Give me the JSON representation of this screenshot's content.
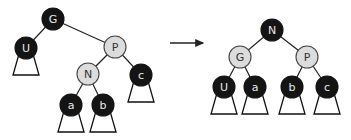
{
  "colors": {
    "black_fill": "#141414",
    "black_text": "#e8e8e8",
    "light_fill": "#dcdcdc",
    "light_stroke": "#444444",
    "light_text": "#333333",
    "edge": "#222222",
    "subtree": "#111111"
  },
  "arrow": {
    "x1": 170,
    "y1": 43,
    "x2": 207,
    "y2": 43
  },
  "trees": [
    {
      "name": "before-rotation",
      "nodes": [
        {
          "id": "G",
          "label": "G",
          "x": 53,
          "y": 19,
          "color": "black"
        },
        {
          "id": "U",
          "label": "U",
          "x": 26,
          "y": 48,
          "color": "black"
        },
        {
          "id": "P",
          "label": "P",
          "x": 115,
          "y": 47,
          "color": "light"
        },
        {
          "id": "N",
          "label": "N",
          "x": 88,
          "y": 74,
          "color": "light"
        },
        {
          "id": "c",
          "label": "c",
          "x": 141,
          "y": 75,
          "color": "black"
        },
        {
          "id": "a",
          "label": "a",
          "x": 71,
          "y": 105,
          "color": "black"
        },
        {
          "id": "b",
          "label": "b",
          "x": 103,
          "y": 105,
          "color": "black"
        }
      ],
      "edges": [
        [
          "G",
          "U"
        ],
        [
          "G",
          "P"
        ],
        [
          "P",
          "N"
        ],
        [
          "P",
          "c"
        ],
        [
          "N",
          "a"
        ],
        [
          "N",
          "b"
        ]
      ],
      "subtrees": [
        "U",
        "c",
        "a",
        "b"
      ]
    },
    {
      "name": "after-rotation",
      "nodes": [
        {
          "id": "N",
          "label": "N",
          "x": 272,
          "y": 30,
          "color": "black"
        },
        {
          "id": "G",
          "label": "G",
          "x": 240,
          "y": 57,
          "color": "light"
        },
        {
          "id": "P",
          "label": "P",
          "x": 307,
          "y": 57,
          "color": "light"
        },
        {
          "id": "U",
          "label": "U",
          "x": 224,
          "y": 87,
          "color": "black"
        },
        {
          "id": "a",
          "label": "a",
          "x": 255,
          "y": 87,
          "color": "black"
        },
        {
          "id": "b",
          "label": "b",
          "x": 292,
          "y": 87,
          "color": "black"
        },
        {
          "id": "c",
          "label": "c",
          "x": 327,
          "y": 87,
          "color": "black"
        }
      ],
      "edges": [
        [
          "N",
          "G"
        ],
        [
          "N",
          "P"
        ],
        [
          "G",
          "U"
        ],
        [
          "G",
          "a"
        ],
        [
          "P",
          "b"
        ],
        [
          "P",
          "c"
        ]
      ],
      "subtrees": [
        "U",
        "a",
        "b",
        "c"
      ]
    }
  ]
}
